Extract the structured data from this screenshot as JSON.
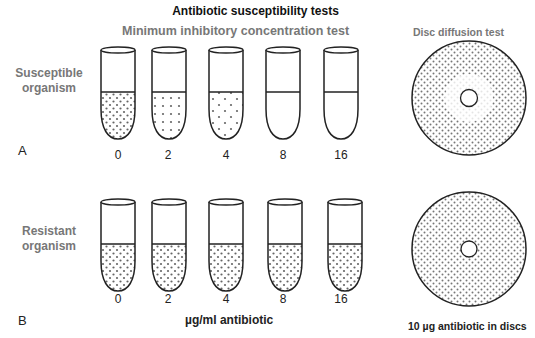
{
  "title": "Antibiotic susceptibility tests",
  "mic_test": {
    "title": "Minimum inhibitory concentration test",
    "unit_label": "µg/ml antibiotic",
    "concentrations": [
      "0",
      "2",
      "4",
      "8",
      "16"
    ]
  },
  "disc_test": {
    "title": "Disc diffusion test",
    "note": "10 µg antibiotic in discs"
  },
  "panels": [
    {
      "letter": "A",
      "label_line1": "Susceptible",
      "label_line2": "organism",
      "tube_growth": [
        "dense",
        "medium",
        "sparse",
        "none",
        "none"
      ],
      "disc_clear_zone": true
    },
    {
      "letter": "B",
      "label_line1": "Resistant",
      "label_line2": "organism",
      "tube_growth": [
        "dense",
        "dense",
        "dense",
        "dense",
        "dense"
      ],
      "disc_clear_zone": false
    }
  ],
  "colors": {
    "line": "#222222",
    "dot": "#666666",
    "gray_text": "#777777"
  }
}
